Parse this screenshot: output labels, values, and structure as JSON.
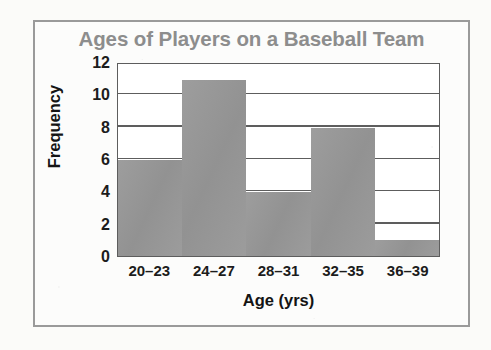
{
  "chart_data": {
    "type": "bar",
    "title": "Ages of Players on a Baseball Team",
    "xlabel": "Age (yrs)",
    "ylabel": "Frequency",
    "categories": [
      "20–23",
      "24–27",
      "28–31",
      "32–35",
      "36–39"
    ],
    "values": [
      6,
      11,
      4,
      8,
      1
    ],
    "ylim": [
      0,
      12
    ],
    "ytick_labels": [
      "0",
      "2",
      "4",
      "6",
      "8",
      "10",
      "12"
    ],
    "ytick_values": [
      0,
      2,
      4,
      6,
      8,
      10,
      12
    ],
    "grid": "horizontal",
    "legend": null,
    "colors": {
      "bar": "#989898",
      "title": "#8d8d8d",
      "axis": "#5d5d5d",
      "text": "#1c1c1c",
      "frame": "#9a9a9a",
      "plot_background": "#ffffff",
      "page_background": "#fbfbf9"
    }
  }
}
